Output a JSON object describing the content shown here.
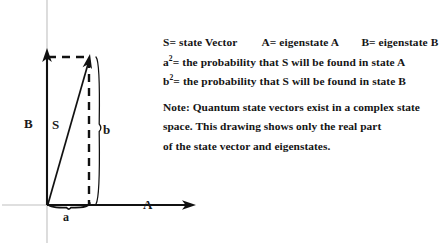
{
  "diagram": {
    "axis_labels": {
      "y_axis": "B",
      "x_axis": "A",
      "vector": "S",
      "vertical_component": "b",
      "horizontal_component": "a"
    },
    "icons": {
      "y_axis_arrow": "arrow-up-icon",
      "x_axis_arrow": "arrow-right-icon",
      "state_vector_arrow": "vector-arrow-icon",
      "brace_vertical": "curly-brace-vertical-icon",
      "brace_horizontal": "curly-brace-horizontal-icon",
      "projection_dashed_horizontal": "dashed-line-icon",
      "projection_dashed_vertical": "dashed-line-icon"
    },
    "colors": {
      "stroke": "#111111",
      "guide": "#b9b9b9",
      "background": "#ffffff"
    }
  },
  "legend": {
    "line1": {
      "state_vector": "S= state Vector",
      "eigenstate_a": "A= eigenstate A",
      "eigenstate_b": "B= eigenstate B"
    },
    "line2": {
      "symbol": "a",
      "exponent": "2",
      "text": "= the probability that S will be found in state A"
    },
    "line3": {
      "symbol": "b",
      "exponent": "2",
      "text": "= the probability that S will be found in state B"
    }
  },
  "note": {
    "line1": "Note: Quantum state vectors exist in a complex state",
    "line2": "space. This drawing shows only the real part",
    "line3": "of the state vector and eigenstates."
  }
}
